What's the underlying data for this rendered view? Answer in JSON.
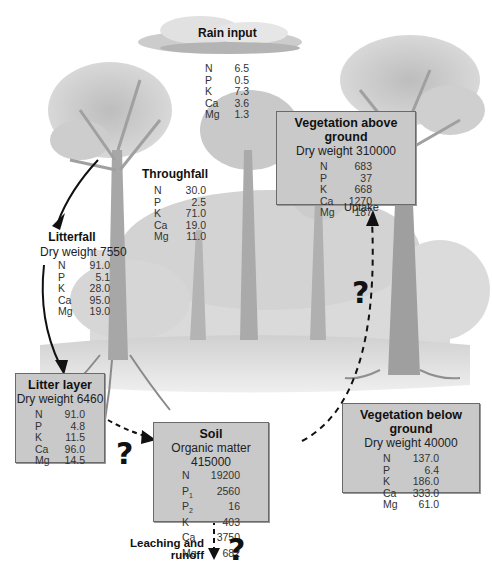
{
  "rain_input": {
    "title": "Rain input",
    "nutrients": [
      {
        "el": "N",
        "val": "6.5"
      },
      {
        "el": "P",
        "val": "0.5"
      },
      {
        "el": "K",
        "val": "7.3"
      },
      {
        "el": "Ca",
        "val": "3.6"
      },
      {
        "el": "Mg",
        "val": "1.3"
      }
    ]
  },
  "throughfall": {
    "title": "Throughfall",
    "nutrients": [
      {
        "el": "N",
        "val": "30.0"
      },
      {
        "el": "P",
        "val": "2.5"
      },
      {
        "el": "K",
        "val": "71.0"
      },
      {
        "el": "Ca",
        "val": "19.0"
      },
      {
        "el": "Mg",
        "val": "11.0"
      }
    ]
  },
  "litterfall": {
    "title": "Litterfall",
    "subtitle": "Dry weight 7550",
    "nutrients": [
      {
        "el": "N",
        "val": "91.0"
      },
      {
        "el": "P",
        "val": "5.1"
      },
      {
        "el": "K",
        "val": "28.0"
      },
      {
        "el": "Ca",
        "val": "95.0"
      },
      {
        "el": "Mg",
        "val": "19.0"
      }
    ]
  },
  "vegetation_above": {
    "title": "Vegetation above ground",
    "subtitle": "Dry weight 310000",
    "nutrients": [
      {
        "el": "N",
        "val": "683"
      },
      {
        "el": "P",
        "val": "37"
      },
      {
        "el": "K",
        "val": "668"
      },
      {
        "el": "Ca",
        "val": "1270"
      },
      {
        "el": "Mg",
        "val": "187"
      }
    ]
  },
  "uptake": {
    "label": "Uptake",
    "question": "?"
  },
  "litter_layer": {
    "title": "Litter layer",
    "subtitle": "Dry weight 6460",
    "nutrients": [
      {
        "el": "N",
        "val": "91.0"
      },
      {
        "el": "P",
        "val": "4.8"
      },
      {
        "el": "K",
        "val": "11.5"
      },
      {
        "el": "Ca",
        "val": "96.0"
      },
      {
        "el": "Mg",
        "val": "14.5"
      }
    ],
    "question": "?"
  },
  "soil": {
    "title": "Soil",
    "subtitle": "Organic matter 415000",
    "nutrients": [
      {
        "el": "N",
        "sub": "",
        "val": "19200"
      },
      {
        "el": "P",
        "sub": "1",
        "val": "2560"
      },
      {
        "el": "P",
        "sub": "2",
        "val": "16"
      },
      {
        "el": "K",
        "sub": "",
        "val": "403"
      },
      {
        "el": "Ca",
        "sub": "",
        "val": "3750"
      },
      {
        "el": "Mg",
        "sub": "",
        "val": "682"
      }
    ]
  },
  "vegetation_below": {
    "title": "Vegetation below ground",
    "subtitle": "Dry weight 40000",
    "nutrients": [
      {
        "el": "N",
        "val": "137.0"
      },
      {
        "el": "P",
        "val": "6.4"
      },
      {
        "el": "K",
        "val": "186.0"
      },
      {
        "el": "Ca",
        "val": "333.0"
      },
      {
        "el": "Mg",
        "val": "61.0"
      }
    ]
  },
  "leaching": {
    "line1": "Leaching and",
    "line2": "runoff",
    "question": "?"
  },
  "colors": {
    "box_fill": "#c9c9c9",
    "box_border": "#6a6a6a",
    "arrow": "#111111",
    "illustration": "#9a9a9a"
  }
}
